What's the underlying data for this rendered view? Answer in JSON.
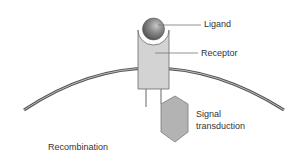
{
  "diagram": {
    "colors": {
      "membrane_outer": "#555555",
      "membrane_inner": "#bbbbbb",
      "receptor_fill": "#d3d3d3",
      "receptor_stroke": "#666666",
      "ligand_light": "#bdbdbd",
      "ligand_dark": "#5a5a5a",
      "hexagon_fill": "#b3b3b3",
      "hexagon_stroke": "#7a7a7a",
      "leader_line": "#777777",
      "text": "#333333"
    },
    "labels": {
      "ligand": "Ligand",
      "receptor": "Receptor",
      "signal_line1": "Signal",
      "signal_line2": "transduction",
      "recombination": "Recombination"
    }
  }
}
